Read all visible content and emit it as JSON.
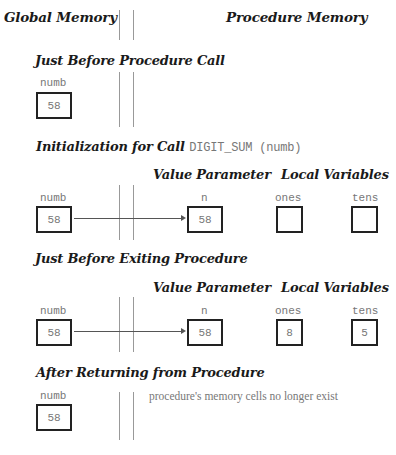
{
  "header": {
    "global_title": "Global Memory",
    "procedure_title": "Procedure Memory"
  },
  "stages": [
    {
      "title": "Just Before Procedure Call",
      "global": {
        "name": "numb",
        "value": "58"
      }
    },
    {
      "title": "Initialization for Call",
      "code": "DIGIT_SUM (numb)",
      "value_param_heading": "Value Parameter",
      "local_vars_heading": "Local Variables",
      "global": {
        "name": "numb",
        "value": "58"
      },
      "param": {
        "name": "n",
        "value": "58"
      },
      "locals": [
        {
          "name": "ones",
          "value": ""
        },
        {
          "name": "tens",
          "value": ""
        }
      ]
    },
    {
      "title": "Just Before Exiting Procedure",
      "value_param_heading": "Value Parameter",
      "local_vars_heading": "Local Variables",
      "global": {
        "name": "numb",
        "value": "58"
      },
      "param": {
        "name": "n",
        "value": "58"
      },
      "locals": [
        {
          "name": "ones",
          "value": "8"
        },
        {
          "name": "tens",
          "value": "5"
        }
      ]
    },
    {
      "title": "After Returning from Procedure",
      "global": {
        "name": "numb",
        "value": "58"
      },
      "note": "procedure's memory cells no longer exist"
    }
  ]
}
